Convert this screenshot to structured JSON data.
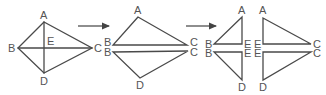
{
  "diagram": {
    "colors": {
      "line": "#4a4a4a",
      "label": "#555555",
      "background": "#ffffff"
    },
    "figure1": {
      "name": "kite",
      "labels": {
        "A": "A",
        "B": "B",
        "C": "C",
        "D": "D",
        "E": "E"
      }
    },
    "arrow1": {
      "direction": "right"
    },
    "figure2": {
      "name": "two-triangles",
      "upper": {
        "A": "A",
        "B": "B",
        "C": "C"
      },
      "lower": {
        "B": "B",
        "C": "C",
        "D": "D"
      }
    },
    "arrow2": {
      "direction": "right"
    },
    "figure3": {
      "name": "four-right-triangles",
      "top_left": {
        "A": "A",
        "B": "B",
        "E": "E"
      },
      "bottom_left": {
        "B": "B",
        "E": "E",
        "D": "D"
      },
      "top_right": {
        "A": "A",
        "E": "E",
        "C": "C"
      },
      "bottom_right": {
        "E": "E",
        "C": "C",
        "D": "D"
      }
    }
  }
}
